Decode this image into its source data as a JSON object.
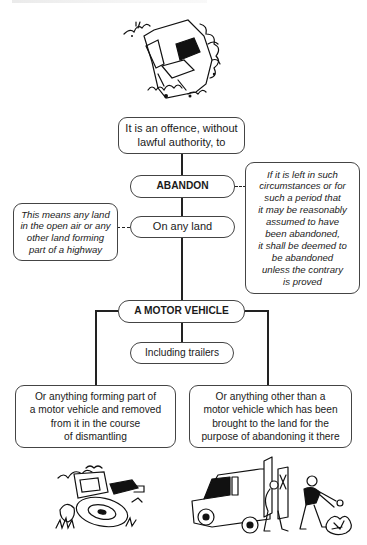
{
  "diagram": {
    "type": "flowchart",
    "nodes": {
      "offence": "It is an offence, without lawful authority, to",
      "abandon": "ABANDON",
      "on_any_land": "On any land",
      "land_note": "This means any land in the open air or any other land forming part of a highway",
      "deemed_note": "If it is left in such circumstances or for such a period that it may be reasonably assumed to have been abandoned, it shall be deemed to be abandoned unless the contrary is proved",
      "motor_vehicle": "A MOTOR VEHICLE",
      "including_trailers": "Including trailers",
      "part_of_vehicle": "Or anything forming part of a motor vehicle and removed from it in the course of dismantling",
      "other_than_vehicle": "Or anything other than a motor vehicle which has been brought to the land for the purpose of abandoning it there"
    },
    "lines": {
      "offence_1": "It is an offence, without",
      "offence_2": "lawful authority, to",
      "land_note_1": "This means any land",
      "land_note_2": "in the open air or any",
      "land_note_3": "other land forming",
      "land_note_4": "part of a highway",
      "deemed_1": "If it is left in such",
      "deemed_2": "circumstances or for",
      "deemed_3": "such a period that",
      "deemed_4": "it may be reasonably",
      "deemed_5": "assumed to have",
      "deemed_6": "been abandoned,",
      "deemed_7": "it shall be deemed to",
      "deemed_8": "be abandoned",
      "deemed_9": "unless the contrary",
      "deemed_10": "is proved",
      "part_1": "Or anything forming part of",
      "part_2": "a motor vehicle and removed",
      "part_3": "from it in the course",
      "part_4": "of dismantling",
      "other_1": "Or anything other than a",
      "other_2": "motor vehicle which has been",
      "other_3": "brought to the land for the",
      "other_4": "purpose of abandoning it there"
    },
    "edges": [
      {
        "from": "offence",
        "to": "abandon",
        "style": "solid"
      },
      {
        "from": "abandon",
        "to": "on_any_land",
        "style": "solid"
      },
      {
        "from": "abandon",
        "to": "deemed_note",
        "style": "dashed"
      },
      {
        "from": "on_any_land",
        "to": "land_note",
        "style": "dashed"
      },
      {
        "from": "on_any_land",
        "to": "motor_vehicle",
        "style": "solid"
      },
      {
        "from": "motor_vehicle",
        "to": "including_trailers",
        "style": "solid"
      },
      {
        "from": "motor_vehicle",
        "to": "part_of_vehicle",
        "style": "solid"
      },
      {
        "from": "motor_vehicle",
        "to": "other_than_vehicle",
        "style": "solid"
      }
    ],
    "illustrations": {
      "top": "abandoned-car-in-bushes-illustration",
      "bottom_left": "dismantled-vehicle-parts-illustration",
      "bottom_right": "van-unloading-rubbish-illustration"
    }
  }
}
